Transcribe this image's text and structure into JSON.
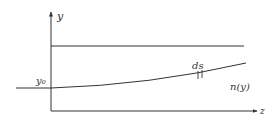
{
  "diagram": {
    "axes": {
      "y_label": "y",
      "z_label": "z"
    },
    "labels": {
      "y0": "y₀",
      "ds": "ds",
      "n": "n(y)"
    },
    "colors": {
      "stroke": "#333333",
      "background": "#ffffff"
    }
  }
}
